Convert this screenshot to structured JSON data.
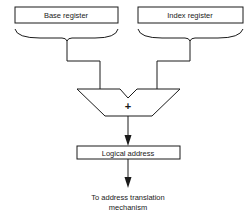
{
  "diagram": {
    "type": "address-computation",
    "nodes": {
      "base_register": {
        "label": "Base register"
      },
      "index_register": {
        "label": "Index register"
      },
      "adder": {
        "symbol": "+"
      },
      "logical_address": {
        "label": "Logical address"
      },
      "output": {
        "line1": "To address translation",
        "line2": "mechanism"
      }
    },
    "edges": [
      {
        "from": "base_register",
        "to": "adder"
      },
      {
        "from": "index_register",
        "to": "adder"
      },
      {
        "from": "adder",
        "to": "logical_address",
        "arrow": true
      },
      {
        "from": "logical_address",
        "to": "output",
        "arrow": true
      }
    ],
    "colors": {
      "ink": "#1a1a1a",
      "background": "#ffffff"
    }
  }
}
